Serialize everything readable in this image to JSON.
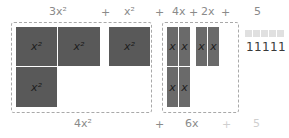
{
  "top_labels": {
    "term1": "3x²",
    "plus1": "+",
    "term2": "x²",
    "plus2": "+",
    "term3": "4x",
    "plus3": "+",
    "term4": "2x",
    "plus4": "+",
    "term5": "5"
  },
  "tiles": {
    "square_label": "x²",
    "bar_label": "x",
    "unit_label": "1"
  },
  "bottom_labels": {
    "term1": "4x²",
    "plus1": "+",
    "term2": "6x",
    "plus2": "+",
    "term3": "5"
  },
  "colors": {
    "square": "#595959",
    "bar": "#6a6a6a",
    "unit": "#e0e0e0",
    "dashed_border": "#a9a9a9"
  }
}
